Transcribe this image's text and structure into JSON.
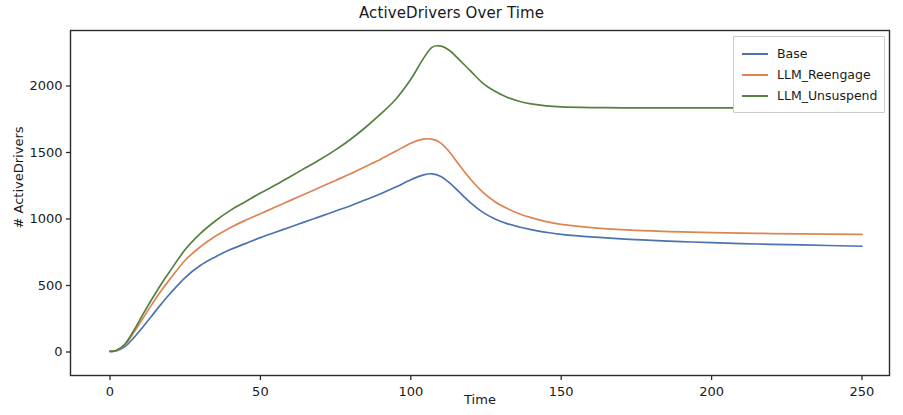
{
  "chart_data": {
    "type": "line",
    "title": "ActiveDrivers Over Time",
    "xlabel": "Time",
    "ylabel": "# ActiveDrivers",
    "xlim": [
      -8,
      258
    ],
    "ylim": [
      -120,
      2420
    ],
    "xticks": [
      0,
      50,
      100,
      150,
      200,
      250
    ],
    "xtick_labels": [
      "0",
      "50",
      "100",
      "150",
      "200",
      "250"
    ],
    "yticks": [
      0,
      500,
      1000,
      1500,
      2000
    ],
    "ytick_labels": [
      "0",
      "500",
      "1000",
      "1500",
      "2000"
    ],
    "grid": false,
    "legend_position": "upper right",
    "colors": {
      "base": "#4c72b0",
      "reengage": "#dd8452",
      "unsuspend": "#55803f"
    },
    "series": [
      {
        "name": "Base",
        "color": "#4c72b0",
        "x": [
          0,
          2,
          5,
          8,
          11,
          14,
          17,
          20,
          25,
          30,
          35,
          40,
          45,
          50,
          55,
          60,
          65,
          70,
          75,
          80,
          85,
          90,
          95,
          100,
          104,
          107,
          110,
          113,
          116,
          120,
          124,
          128,
          132,
          136,
          140,
          145,
          150,
          160,
          170,
          180,
          190,
          200,
          215,
          230,
          250
        ],
        "values": [
          5,
          8,
          40,
          110,
          190,
          275,
          360,
          440,
          560,
          650,
          715,
          770,
          815,
          860,
          900,
          940,
          980,
          1020,
          1060,
          1100,
          1145,
          1190,
          1240,
          1295,
          1330,
          1340,
          1320,
          1270,
          1205,
          1120,
          1050,
          1000,
          965,
          940,
          920,
          900,
          885,
          865,
          850,
          840,
          830,
          822,
          812,
          805,
          795
        ]
      },
      {
        "name": "LLM_Reengage",
        "color": "#dd8452",
        "x": [
          0,
          2,
          5,
          8,
          11,
          14,
          17,
          20,
          25,
          30,
          35,
          40,
          45,
          50,
          55,
          60,
          65,
          70,
          75,
          80,
          85,
          90,
          95,
          100,
          104,
          107,
          110,
          113,
          116,
          120,
          124,
          128,
          132,
          136,
          140,
          145,
          150,
          160,
          170,
          180,
          190,
          200,
          215,
          230,
          250
        ],
        "values": [
          5,
          10,
          55,
          150,
          255,
          360,
          460,
          550,
          690,
          790,
          870,
          935,
          990,
          1040,
          1090,
          1140,
          1190,
          1240,
          1290,
          1340,
          1395,
          1450,
          1510,
          1570,
          1600,
          1600,
          1570,
          1500,
          1410,
          1295,
          1200,
          1130,
          1080,
          1040,
          1010,
          980,
          960,
          935,
          920,
          910,
          903,
          898,
          892,
          888,
          884
        ]
      },
      {
        "name": "LLM_Unsuspend",
        "color": "#55803f",
        "x": [
          0,
          2,
          5,
          8,
          11,
          14,
          17,
          20,
          25,
          30,
          35,
          40,
          45,
          50,
          55,
          60,
          65,
          70,
          75,
          80,
          85,
          90,
          95,
          100,
          104,
          107,
          110,
          113,
          116,
          120,
          124,
          128,
          132,
          136,
          140,
          145,
          150,
          160,
          170,
          180,
          190,
          200,
          215,
          230,
          250
        ],
        "values": [
          5,
          12,
          60,
          165,
          285,
          400,
          510,
          610,
          770,
          890,
          985,
          1065,
          1130,
          1195,
          1255,
          1320,
          1385,
          1450,
          1520,
          1600,
          1690,
          1790,
          1900,
          2050,
          2200,
          2290,
          2300,
          2265,
          2200,
          2110,
          2020,
          1960,
          1915,
          1885,
          1865,
          1850,
          1843,
          1838,
          1836,
          1835,
          1835,
          1835,
          1836,
          1837,
          1838
        ]
      }
    ],
    "legend": [
      {
        "label": "Base",
        "color": "#4c72b0"
      },
      {
        "label": "LLM_Reengage",
        "color": "#dd8452"
      },
      {
        "label": "LLM_Unsuspend",
        "color": "#55803f"
      }
    ]
  }
}
